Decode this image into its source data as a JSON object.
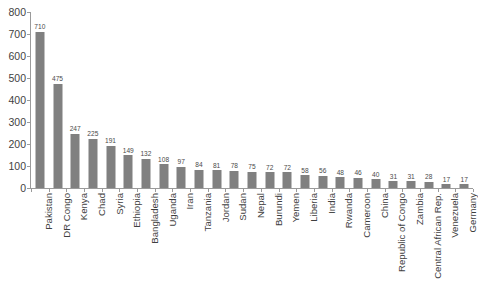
{
  "chart_data": {
    "type": "bar",
    "title": "",
    "xlabel": "",
    "ylabel": "",
    "ylim": [
      0,
      800
    ],
    "ytick_labels": [
      "800",
      "700",
      "600",
      "500",
      "400",
      "300",
      "200",
      "100",
      "0"
    ],
    "yticks": [
      800,
      700,
      600,
      500,
      400,
      300,
      200,
      100,
      0
    ],
    "grid": false,
    "legend": false,
    "bar_color": "#808080",
    "axis_color": "#9a9a9a",
    "categories": [
      "Pakistan",
      "DR Congo",
      "Kenya",
      "Chad",
      "Syria",
      "Ethiopia",
      "Bangladesh",
      "Uganda",
      "Iran",
      "Tanzania",
      "Jordan",
      "Sudan",
      "Nepal",
      "Burundi",
      "Yemen",
      "Liberia",
      "India",
      "Rwanda",
      "Cameroon",
      "China",
      "Republic of Congo",
      "Zambia",
      "Central African Rep.",
      "Venezuela",
      "Germany"
    ],
    "values": [
      710,
      475,
      247,
      225,
      191,
      149,
      132,
      108,
      97,
      84,
      81,
      78,
      75,
      72,
      72,
      58,
      56,
      48,
      46,
      40,
      31,
      31,
      28,
      17,
      17
    ],
    "value_labels": [
      "710",
      "475",
      "247",
      "225",
      "191",
      "149",
      "132",
      "108",
      "97",
      "84",
      "81",
      "78",
      "75",
      "72",
      "72",
      "58",
      "56",
      "48",
      "46",
      "40",
      "31",
      "31",
      "28",
      "17",
      "17"
    ]
  }
}
